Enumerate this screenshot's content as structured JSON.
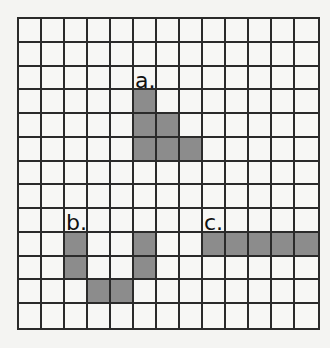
{
  "grid": {
    "rows": 13,
    "cols": 13,
    "colors": {
      "line": "#2a2a2a",
      "empty": "#f7f7f5",
      "shaded": "#8c8c8c"
    }
  },
  "figures": [
    {
      "label": "a.",
      "label_cell": [
        2,
        5
      ],
      "cells": [
        [
          3,
          5
        ],
        [
          4,
          5
        ],
        [
          4,
          6
        ],
        [
          5,
          5
        ],
        [
          5,
          6
        ],
        [
          5,
          7
        ]
      ]
    },
    {
      "label": "b.",
      "label_cell": [
        8,
        2
      ],
      "cells": [
        [
          9,
          2
        ],
        [
          10,
          2
        ],
        [
          9,
          5
        ],
        [
          10,
          5
        ],
        [
          11,
          3
        ],
        [
          11,
          4
        ]
      ]
    },
    {
      "label": "c.",
      "label_cell": [
        8,
        8
      ],
      "cells": [
        [
          9,
          8
        ],
        [
          9,
          9
        ],
        [
          9,
          10
        ],
        [
          9,
          11
        ],
        [
          9,
          12
        ]
      ]
    }
  ]
}
